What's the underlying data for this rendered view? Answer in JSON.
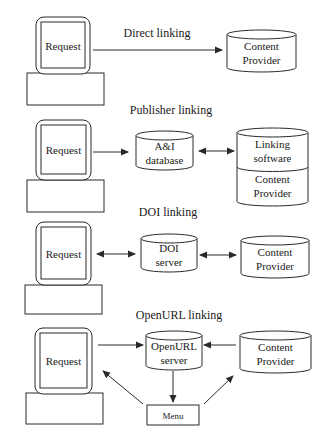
{
  "diagram": {
    "colors": {
      "stroke": "#2a2a2a",
      "text": "#1a1a1a",
      "background": "#ffffff"
    },
    "sections": [
      {
        "id": "direct",
        "title": "Direct linking",
        "title_pos": [
          157,
          37
        ],
        "monitor": {
          "x": 36,
          "y": 17,
          "w": 54,
          "h": 57,
          "base": [
            27,
            73,
            77,
            32
          ],
          "label": "Request"
        },
        "nodes": [
          {
            "id": "cp1",
            "type": "cylinder",
            "x": 227,
            "y": 30,
            "w": 69,
            "h": 42,
            "lines": [
              "Content",
              "Provider"
            ]
          }
        ],
        "edges": [
          {
            "from": [
              93,
              50
            ],
            "to": [
              222,
              50
            ],
            "heads": "end"
          }
        ]
      },
      {
        "id": "publisher",
        "title": "Publisher linking",
        "title_pos": [
          171,
          114
        ],
        "monitor": {
          "x": 36,
          "y": 120,
          "w": 55,
          "h": 60,
          "base": [
            27,
            180,
            77,
            32
          ],
          "label": "Request"
        },
        "nodes": [
          {
            "id": "ai",
            "type": "cylinder",
            "x": 136,
            "y": 131,
            "w": 57,
            "h": 39,
            "lines": [
              "A&I",
              "database"
            ]
          },
          {
            "id": "ls",
            "type": "cylinder-split",
            "x": 237,
            "y": 128,
            "w": 71,
            "h": 78,
            "split": 171,
            "lines": [
              "Linking",
              "software"
            ],
            "lines2": [
              "Content",
              "Provider"
            ]
          }
        ],
        "edges": [
          {
            "from": [
              93,
              152
            ],
            "to": [
              128,
              152
            ],
            "heads": "end"
          },
          {
            "from": [
              199,
              151
            ],
            "to": [
              234,
              151
            ],
            "heads": "both"
          }
        ]
      },
      {
        "id": "doi",
        "title": "DOI linking",
        "title_pos": [
          168,
          216
        ],
        "monitor": {
          "x": 36,
          "y": 222,
          "w": 55,
          "h": 63,
          "base": [
            25,
            285,
            77,
            29
          ],
          "label": "Request"
        },
        "nodes": [
          {
            "id": "doi",
            "type": "cylinder",
            "x": 141,
            "y": 234,
            "w": 56,
            "h": 38,
            "lines": [
              "DOI",
              "server"
            ]
          },
          {
            "id": "cp3",
            "type": "cylinder",
            "x": 241,
            "y": 236,
            "w": 68,
            "h": 42,
            "lines": [
              "Content",
              "Provider"
            ]
          }
        ],
        "edges": [
          {
            "from": [
              97,
              254
            ],
            "to": [
              135,
              254
            ],
            "heads": "both"
          },
          {
            "from": [
              200,
              255
            ],
            "to": [
              236,
              255
            ],
            "heads": "both"
          }
        ]
      },
      {
        "id": "openurl",
        "title": "OpenURL linking",
        "title_pos": [
          179,
          319
        ],
        "monitor": {
          "x": 35,
          "y": 328,
          "w": 57,
          "h": 66,
          "base": [
            26,
            393,
            77,
            31
          ],
          "label": "Request"
        },
        "nodes": [
          {
            "id": "ou",
            "type": "cylinder",
            "x": 146,
            "y": 331,
            "w": 56,
            "h": 39,
            "lines": [
              "OpenURL",
              "server"
            ]
          },
          {
            "id": "cp4",
            "type": "cylinder",
            "x": 240,
            "y": 331,
            "w": 71,
            "h": 42,
            "lines": [
              "Content",
              "Provider"
            ]
          },
          {
            "id": "menu",
            "type": "box",
            "x": 147,
            "y": 405,
            "w": 52,
            "h": 20,
            "lines": [
              "Menu"
            ]
          }
        ],
        "edges": [
          {
            "from": [
              98,
              345
            ],
            "to": [
              143,
              345
            ],
            "heads": "end"
          },
          {
            "from": [
              236,
              345
            ],
            "to": [
              204,
              345
            ],
            "heads": "end"
          },
          {
            "from": [
              173,
              371
            ],
            "to": [
              173,
              402
            ],
            "heads": "end"
          },
          {
            "from": [
              143,
              404
            ],
            "to": [
              103,
              371
            ],
            "heads": "end"
          },
          {
            "from": [
              204,
              404
            ],
            "to": [
              233,
              376
            ],
            "heads": "end"
          }
        ]
      }
    ]
  }
}
